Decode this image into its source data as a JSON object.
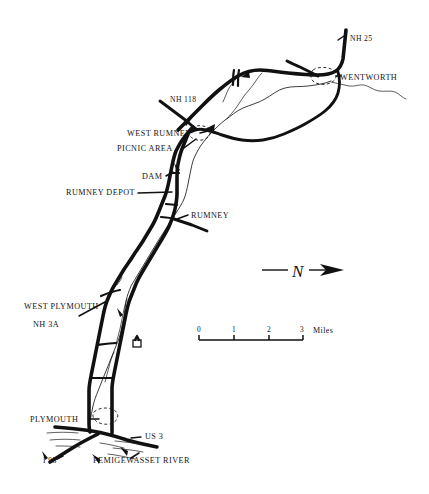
{
  "map": {
    "title": "Baker River Valley Map",
    "background_color": "#ffffff",
    "ink_color": "#111111",
    "labels": {
      "nh_25": "NH 25",
      "wentworth": "WENTWORTH",
      "nh_118": "NH 118",
      "west_rumney": "WEST RUMNEY",
      "picnic_area": "PICNIC AREA",
      "dam": "DAM",
      "rumney_depot": "RUMNEY DEPOT",
      "rumney": "RUMNEY",
      "west_plymouth": "WEST PLYMOUTH",
      "nh_3a": "NH 3A",
      "plymouth": "PLYMOUTH",
      "us_3": "US 3",
      "i_93": "I 93",
      "pemigewasset_river": "PEMIGEWASSET RIVER"
    },
    "compass": {
      "direction": "N",
      "orientation": "points-right-east"
    },
    "scale_bar": {
      "unit": "Miles",
      "ticks": [
        "0",
        "1",
        "2",
        "3"
      ]
    }
  }
}
